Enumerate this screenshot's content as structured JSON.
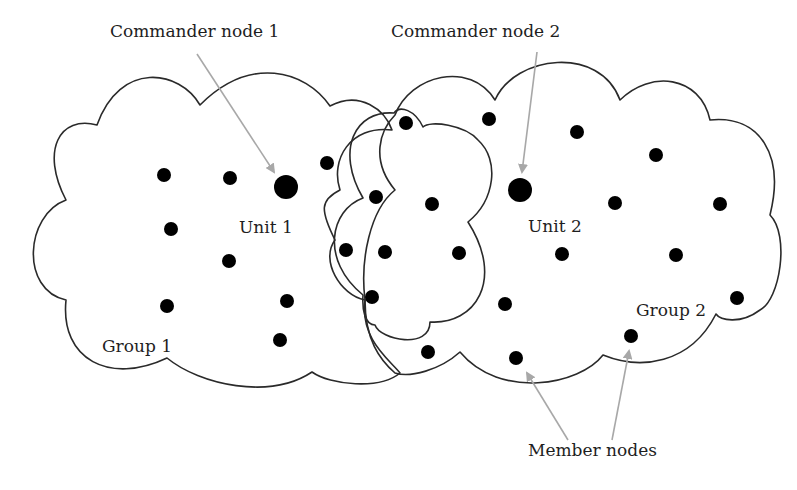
{
  "diagram": {
    "type": "network-topology",
    "labels": {
      "commander_1": "Commander node 1",
      "commander_2": "Commander node 2",
      "unit_1": "Unit 1",
      "unit_2": "Unit 2",
      "group_1": "Group 1",
      "group_2": "Group 2",
      "member_nodes": "Member nodes"
    },
    "colors": {
      "outline": "#2a2a2a",
      "node": "#000000",
      "arrow": "#a8a8a8",
      "background": "#ffffff"
    },
    "regions": [
      {
        "id": "group-1",
        "label": "Group 1",
        "shape": "cloud"
      },
      {
        "id": "group-2",
        "label": "Group 2",
        "shape": "cloud"
      },
      {
        "id": "overlap-subgroup",
        "label": "",
        "shape": "cloud"
      }
    ],
    "commander_nodes": [
      {
        "id": "commander-1",
        "unit": "Unit 1",
        "x": 286,
        "y": 187
      },
      {
        "id": "commander-2",
        "unit": "Unit 2",
        "x": 520,
        "y": 190
      }
    ],
    "member_nodes": {
      "group_1": [
        [
          164,
          175
        ],
        [
          230,
          178
        ],
        [
          327,
          163
        ],
        [
          171,
          229
        ],
        [
          229,
          261
        ],
        [
          167,
          306
        ],
        [
          287,
          301
        ],
        [
          280,
          340
        ]
      ],
      "overlap": [
        [
          406,
          123
        ],
        [
          376,
          197
        ],
        [
          432,
          204
        ],
        [
          346,
          250
        ],
        [
          385,
          252
        ],
        [
          459,
          253
        ],
        [
          372,
          297
        ],
        [
          428,
          352
        ]
      ],
      "group_2": [
        [
          489,
          119
        ],
        [
          577,
          132
        ],
        [
          656,
          155
        ],
        [
          615,
          203
        ],
        [
          720,
          204
        ],
        [
          562,
          254
        ],
        [
          676,
          255
        ],
        [
          505,
          304
        ],
        [
          737,
          298
        ],
        [
          631,
          336
        ],
        [
          516,
          358
        ]
      ]
    },
    "arrows": [
      {
        "from_label": "Commander node 1",
        "to": "commander-1"
      },
      {
        "from_label": "Commander node 2",
        "to": "commander-2"
      },
      {
        "from_label": "Member nodes",
        "to": "member-node-516-358"
      },
      {
        "from_label": "Member nodes",
        "to": "member-node-631-336"
      }
    ]
  }
}
